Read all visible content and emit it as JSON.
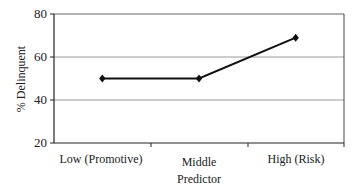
{
  "chart_data": {
    "type": "line",
    "title": "",
    "xlabel": "Predictor",
    "ylabel": "% Delinquent",
    "categories": [
      "Low (Promotive)",
      "Middle",
      "High (Risk)"
    ],
    "series": [
      {
        "name": "% Delinquent",
        "values": [
          50,
          50,
          69
        ],
        "marker": "diamond",
        "color": "#111111"
      }
    ],
    "ylim": [
      20,
      80
    ],
    "yticks": [
      20,
      40,
      60,
      80
    ],
    "grid": true,
    "legend": "none"
  },
  "labels": {
    "ylabel": "% Delinquent",
    "xlabel": "Predictor",
    "yticks": [
      "80",
      "60",
      "40",
      "20"
    ],
    "categories": [
      "Low (Promotive)",
      "Middle",
      "High (Risk)"
    ]
  }
}
